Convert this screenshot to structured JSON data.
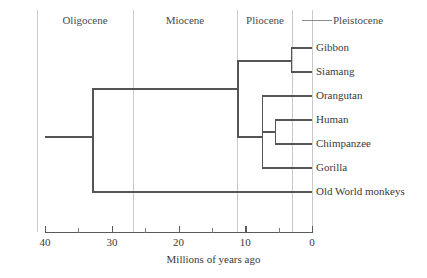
{
  "figure": {
    "type": "phylogenetic-tree-cladogram",
    "axis_title": "Millions of years ago"
  },
  "axis": {
    "title": "Millions of years ago",
    "x_min_value": 40,
    "x_max_value": 0,
    "x_left_px": 45,
    "x_right_px": 312,
    "major_ticks": [
      {
        "value": 40,
        "label": "40"
      },
      {
        "value": 30,
        "label": "30"
      },
      {
        "value": 20,
        "label": "20"
      },
      {
        "value": 10,
        "label": "10"
      },
      {
        "value": 0,
        "label": "0"
      }
    ],
    "minor_ticks": [
      35,
      25,
      15,
      5
    ]
  },
  "epochs": [
    {
      "name": "Oligocene",
      "label": "Oligocene",
      "start": 37.0,
      "end": 23.5,
      "label_x_px": 85,
      "leader": false
    },
    {
      "name": "Miocene",
      "label": "Miocene",
      "start": 23.5,
      "end": 5.3,
      "label_x_px": 185,
      "leader": false
    },
    {
      "name": "Pliocene",
      "label": "Pliocene",
      "start": 5.3,
      "end": 1.8,
      "label_x_px": 264,
      "leader": false
    },
    {
      "name": "Pleistocene",
      "label": "Pleistocene",
      "start": 1.8,
      "end": 0.0,
      "label_x_px": 365,
      "leader": true
    }
  ],
  "epoch_dividers_px": [
    37,
    133,
    237,
    292
  ],
  "taxa": [
    {
      "label": "Gibbon",
      "row": 0,
      "y_px": 48
    },
    {
      "label": "Siamang",
      "row": 1,
      "y_px": 72
    },
    {
      "label": "Orangutan",
      "row": 2,
      "y_px": 96
    },
    {
      "label": "Human",
      "row": 3,
      "y_px": 120
    },
    {
      "label": "Chimpanzee",
      "row": 4,
      "y_px": 144
    },
    {
      "label": "Gorilla",
      "row": 5,
      "y_px": 168
    },
    {
      "label": "Old World monkeys",
      "row": 6,
      "y_px": 192
    }
  ],
  "nodes": [
    {
      "name": "root",
      "x_px": 92,
      "time_mya": 30.0,
      "y_top_px": 89,
      "y_bot_px": 192
    },
    {
      "name": "apes",
      "x_px": 237,
      "time_mya": 11.5,
      "y_top_px": 61,
      "y_bot_px": 137
    },
    {
      "name": "gibbon-siamang",
      "x_px": 291,
      "time_mya": 3.2,
      "y_top_px": 48,
      "y_bot_px": 72
    },
    {
      "name": "great-apes",
      "x_px": 262,
      "time_mya": 7.5,
      "y_top_px": 96,
      "y_bot_px": 168
    },
    {
      "name": "human-chimp",
      "x_px": 275,
      "time_mya": 5.5,
      "y_top_px": 120,
      "y_bot_px": 144
    },
    {
      "name": "root-stem-start",
      "x_px": 45,
      "time_mya": 40.0,
      "y_top_px": 137,
      "y_bot_px": 137
    }
  ],
  "colors": {
    "branch": "#555555",
    "divider": "#c9c9c9",
    "axis": "#5a5a5a",
    "text": "#3a3a3a",
    "background": "#ffffff"
  }
}
